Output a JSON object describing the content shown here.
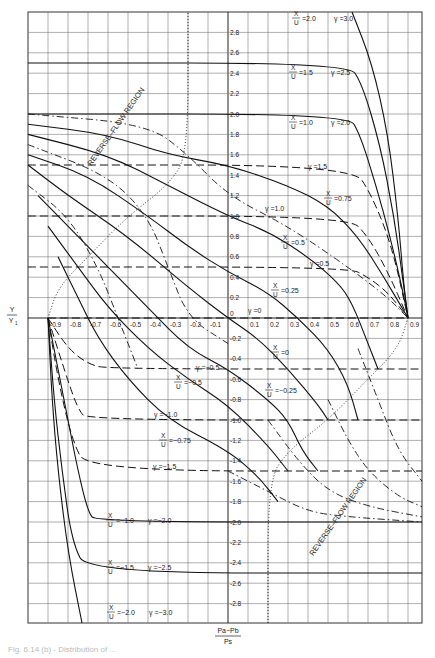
{
  "chart_data": {
    "type": "line",
    "title": "",
    "xlabel": "(Pa - Pb) / Ps",
    "xlabel_parts": {
      "numerator": "Pa−Pb",
      "denominator": "Ps"
    },
    "ylabel": "Y / Y1",
    "ylabel_parts": {
      "numerator": "Y",
      "denominator": "Y1"
    },
    "xlim": [
      -1.0,
      1.0
    ],
    "ylim": [
      -3.0,
      3.0
    ],
    "grid": true,
    "x_ticks": [
      -0.9,
      -0.8,
      -0.7,
      -0.6,
      -0.5,
      -0.4,
      -0.3,
      -0.2,
      -0.1,
      0,
      0.1,
      0.2,
      0.3,
      0.4,
      0.5,
      0.6,
      0.7,
      0.8,
      0.9
    ],
    "x_tick_labels": [
      "-0.9",
      "-0.8",
      "-0.7",
      "-0.6",
      "-0.5",
      "-0.4",
      "-0.3",
      "-0.2",
      "-0.1",
      "0",
      "0.1",
      "0.2",
      "0.3",
      "0.4",
      "0.5",
      "0.6",
      "0.7",
      "0.8",
      "0.9"
    ],
    "y_ticks": [
      2.8,
      2.6,
      2.4,
      2.2,
      2.0,
      1.8,
      1.6,
      1.4,
      1.2,
      1.0,
      0.8,
      0.6,
      0.4,
      0.2,
      -0.2,
      -0.4,
      -0.6,
      -0.8,
      -1.0,
      -1.2,
      -1.4,
      -1.6,
      -1.8,
      -2.0,
      -2.2,
      -2.4,
      -2.6,
      -2.8
    ],
    "y_tick_labels": [
      "2.8",
      "2.6",
      "2.4",
      "2.2",
      "2.0",
      "1.8",
      "1.6",
      "1.4",
      "1.2",
      "1.0",
      "0.8",
      "0.6",
      "0.4",
      "0.2",
      "-0.2",
      "-0.4",
      "-0.6",
      "-0.8",
      "-1.0",
      "-1.2",
      "-1.4",
      "-1.6",
      "-1.8",
      "-2.0",
      "-2.2",
      "-2.4",
      "-2.6",
      "-2.8"
    ],
    "series_solid_x_over_u": [
      {
        "name": "X/U = 2.0",
        "label": "X/U = 2.0  γ = 3.0",
        "points": [
          [
            0.62,
            3.0
          ],
          [
            0.72,
            2.5
          ],
          [
            0.8,
            1.8
          ],
          [
            0.85,
            1.0
          ],
          [
            0.88,
            0.3
          ],
          [
            0.9,
            0.0
          ]
        ]
      },
      {
        "name": "X/U = 1.5",
        "label": "X/U = 1.5  γ = 2.5",
        "points": [
          [
            -1.0,
            2.5
          ],
          [
            0.6,
            2.5
          ],
          [
            0.67,
            2.3
          ],
          [
            0.76,
            1.7
          ],
          [
            0.83,
            1.0
          ],
          [
            0.88,
            0.3
          ],
          [
            0.9,
            0.0
          ]
        ]
      },
      {
        "name": "X/U = 1.0",
        "label": "X/U = 1.0  γ = 2.0",
        "points": [
          [
            -1.0,
            2.0
          ],
          [
            0.6,
            2.0
          ],
          [
            0.66,
            1.8
          ],
          [
            0.74,
            1.3
          ],
          [
            0.81,
            0.8
          ],
          [
            0.87,
            0.3
          ],
          [
            0.9,
            0.0
          ]
        ]
      },
      {
        "name": "X/U = 0.75",
        "label": "X/U = 0.75",
        "points": [
          [
            -1.0,
            1.9
          ],
          [
            -0.6,
            1.8
          ],
          [
            -0.3,
            1.6
          ],
          [
            0.0,
            1.5
          ],
          [
            0.3,
            1.3
          ],
          [
            0.5,
            1.1
          ],
          [
            0.65,
            0.8
          ],
          [
            0.78,
            0.4
          ],
          [
            0.9,
            0.0
          ]
        ]
      },
      {
        "name": "X/U = 0.5",
        "label": "X/U = 0.5",
        "points": [
          [
            -1.0,
            1.8
          ],
          [
            -0.6,
            1.6
          ],
          [
            -0.3,
            1.3
          ],
          [
            0.0,
            1.0
          ],
          [
            0.2,
            0.85
          ],
          [
            0.4,
            0.6
          ],
          [
            0.55,
            0.35
          ],
          [
            0.62,
            0.15
          ],
          [
            0.7,
            -0.25
          ],
          [
            0.75,
            -0.5
          ]
        ]
      },
      {
        "name": "X/U = 0.25",
        "label": "X/U = 0.25",
        "points": [
          [
            -1.0,
            1.6
          ],
          [
            -0.7,
            1.4
          ],
          [
            -0.4,
            1.0
          ],
          [
            -0.2,
            0.7
          ],
          [
            0.0,
            0.45
          ],
          [
            0.2,
            0.25
          ],
          [
            0.35,
            0.0
          ],
          [
            0.5,
            -0.3
          ],
          [
            0.6,
            -0.65
          ],
          [
            0.65,
            -1.0
          ]
        ]
      },
      {
        "name": "X/U = 0",
        "label": "X/U = 0  γ = 0",
        "points": [
          [
            -1.0,
            1.5
          ],
          [
            -0.8,
            1.2
          ],
          [
            -0.5,
            0.8
          ],
          [
            -0.2,
            0.3
          ],
          [
            0.0,
            0.0
          ],
          [
            0.15,
            -0.2
          ],
          [
            0.3,
            -0.5
          ],
          [
            0.45,
            -0.85
          ],
          [
            0.5,
            -1.0
          ]
        ]
      },
      {
        "name": "X/U = -0.25",
        "label": "X/U = -0.25",
        "points": [
          [
            -0.95,
            1.2
          ],
          [
            -0.8,
            0.9
          ],
          [
            -0.6,
            0.5
          ],
          [
            -0.4,
            0.1
          ],
          [
            -0.2,
            -0.3
          ],
          [
            0.0,
            -0.5
          ],
          [
            0.2,
            -0.8
          ],
          [
            0.3,
            -1.0
          ],
          [
            0.37,
            -1.3
          ],
          [
            0.45,
            -1.5
          ]
        ]
      },
      {
        "name": "X/U = -0.5",
        "label": "X/U = -0.5",
        "points": [
          [
            -0.9,
            0.9
          ],
          [
            -0.75,
            0.5
          ],
          [
            -0.6,
            0.1
          ],
          [
            -0.4,
            -0.3
          ],
          [
            -0.2,
            -0.6
          ],
          [
            0.0,
            -0.85
          ],
          [
            0.2,
            -1.25
          ],
          [
            0.3,
            -1.5
          ]
        ]
      },
      {
        "name": "X/U = -0.75",
        "label": "X/U = -0.75",
        "points": [
          [
            -0.85,
            0.6
          ],
          [
            -0.75,
            0.2
          ],
          [
            -0.65,
            -0.2
          ],
          [
            -0.5,
            -0.6
          ],
          [
            -0.3,
            -1.0
          ],
          [
            0.0,
            -1.3
          ],
          [
            0.15,
            -1.55
          ],
          [
            0.25,
            -1.8
          ]
        ]
      },
      {
        "name": "X/U = -1.0",
        "label": "X/U = -1.0  γ = -2.0",
        "points": [
          [
            -0.9,
            0.0
          ],
          [
            -0.85,
            -0.5
          ],
          [
            -0.8,
            -1.0
          ],
          [
            -0.75,
            -1.5
          ],
          [
            -0.7,
            -1.9
          ],
          [
            -0.66,
            -2.0
          ],
          [
            1.0,
            -2.0
          ]
        ]
      },
      {
        "name": "X/U = -1.5",
        "label": "X/U = -1.5  γ = -2.5",
        "points": [
          [
            -0.9,
            0.0
          ],
          [
            -0.87,
            -0.8
          ],
          [
            -0.83,
            -1.5
          ],
          [
            -0.78,
            -2.2
          ],
          [
            -0.7,
            -2.5
          ],
          [
            1.0,
            -2.5
          ]
        ]
      },
      {
        "name": "X/U = -2.0",
        "label": "X/U = -2.0  γ = -3.0",
        "points": [
          [
            -0.9,
            0.0
          ],
          [
            -0.88,
            -0.8
          ],
          [
            -0.85,
            -1.5
          ],
          [
            -0.8,
            -2.3
          ],
          [
            -0.73,
            -3.0
          ]
        ]
      }
    ],
    "series_dashed_gamma": [
      {
        "name": "γ = 1.5",
        "value": 1.5,
        "points": [
          [
            -1.0,
            1.5
          ],
          [
            0.62,
            1.5
          ],
          [
            0.72,
            1.2
          ],
          [
            0.82,
            0.7
          ],
          [
            0.9,
            0.0
          ]
        ]
      },
      {
        "name": "γ = 1.0",
        "value": 1.0,
        "points": [
          [
            -1.0,
            1.0
          ],
          [
            0.6,
            1.0
          ],
          [
            0.7,
            0.8
          ],
          [
            0.8,
            0.45
          ],
          [
            0.9,
            0.0
          ]
        ]
      },
      {
        "name": "γ = 0.5",
        "value": 0.5,
        "points": [
          [
            -1.0,
            0.5
          ],
          [
            0.6,
            0.5
          ],
          [
            0.7,
            0.4
          ],
          [
            0.8,
            0.25
          ],
          [
            0.9,
            0.0
          ]
        ]
      },
      {
        "name": "γ = 0",
        "value": 0,
        "points": [
          [
            -0.9,
            0.0
          ],
          [
            0.9,
            0.0
          ]
        ]
      },
      {
        "name": "γ = -0.5",
        "value": -0.5,
        "points": [
          [
            -0.9,
            0.0
          ],
          [
            -0.8,
            -0.3
          ],
          [
            -0.7,
            -0.45
          ],
          [
            -0.6,
            -0.5
          ],
          [
            1.0,
            -0.5
          ]
        ]
      },
      {
        "name": "γ = -1.0",
        "value": -1.0,
        "points": [
          [
            -0.9,
            0.0
          ],
          [
            -0.82,
            -0.5
          ],
          [
            -0.75,
            -0.9
          ],
          [
            -0.7,
            -1.0
          ],
          [
            1.0,
            -1.0
          ]
        ]
      },
      {
        "name": "γ = -1.5",
        "value": -1.5,
        "points": [
          [
            -0.9,
            0.0
          ],
          [
            -0.85,
            -0.6
          ],
          [
            -0.78,
            -1.2
          ],
          [
            -0.7,
            -1.5
          ],
          [
            1.0,
            -1.5
          ]
        ]
      }
    ],
    "series_dash_dot": [
      {
        "name": "dash-dot upper 1",
        "points": [
          [
            -1.0,
            2.0
          ],
          [
            -0.4,
            1.9
          ],
          [
            -0.2,
            1.6
          ],
          [
            0.0,
            1.2
          ],
          [
            0.3,
            0.9
          ],
          [
            0.6,
            0.5
          ],
          [
            0.8,
            0.2
          ],
          [
            0.9,
            0.0
          ]
        ]
      },
      {
        "name": "dash-dot upper 2",
        "points": [
          [
            -1.0,
            1.7
          ],
          [
            -0.6,
            1.4
          ],
          [
            -0.4,
            1.0
          ],
          [
            -0.3,
            0.5
          ],
          [
            -0.2,
            0.0
          ],
          [
            0.0,
            -0.25
          ]
        ]
      },
      {
        "name": "dash-dot upper 3",
        "points": [
          [
            -1.0,
            1.3
          ],
          [
            -0.8,
            1.0
          ],
          [
            -0.65,
            0.5
          ],
          [
            -0.55,
            0.0
          ],
          [
            -0.45,
            -0.5
          ]
        ]
      },
      {
        "name": "dash-dot lower 1",
        "points": [
          [
            0.0,
            -1.5
          ],
          [
            0.2,
            -1.7
          ],
          [
            0.4,
            -1.9
          ],
          [
            0.6,
            -1.95
          ],
          [
            1.0,
            -2.0
          ]
        ]
      },
      {
        "name": "dash-dot lower 2",
        "points": [
          [
            0.2,
            -1.0
          ],
          [
            0.35,
            -1.4
          ],
          [
            0.5,
            -1.7
          ],
          [
            0.7,
            -1.85
          ],
          [
            1.0,
            -1.95
          ]
        ]
      },
      {
        "name": "dash-dot lower 3",
        "points": [
          [
            0.5,
            -0.8
          ],
          [
            0.6,
            -1.2
          ],
          [
            0.7,
            -1.5
          ],
          [
            0.85,
            -1.75
          ],
          [
            1.0,
            -1.85
          ]
        ]
      },
      {
        "name": "dash-dot lower 4",
        "points": [
          [
            0.65,
            -0.3
          ],
          [
            0.75,
            -0.8
          ],
          [
            0.85,
            -1.3
          ],
          [
            1.0,
            -1.6
          ]
        ]
      }
    ],
    "reverse_flow_boundaries": [
      {
        "name": "upper boundary (dotted)",
        "points": [
          [
            -0.9,
            0.0
          ],
          [
            -0.85,
            0.3
          ],
          [
            -0.7,
            0.6
          ],
          [
            -0.5,
            1.0
          ],
          [
            -0.3,
            1.3
          ],
          [
            -0.2,
            1.6
          ],
          [
            -0.2,
            3.0
          ]
        ]
      },
      {
        "name": "lower boundary (dotted)",
        "points": [
          [
            0.9,
            0.0
          ],
          [
            0.85,
            -0.3
          ],
          [
            0.7,
            -0.6
          ],
          [
            0.5,
            -1.0
          ],
          [
            0.3,
            -1.3
          ],
          [
            0.2,
            -1.6
          ],
          [
            0.2,
            -3.0
          ]
        ]
      }
    ],
    "annotations": [
      {
        "text": "REVERSE–FLOW REGION",
        "x": -0.55,
        "y": 0.9,
        "rotation": -55
      },
      {
        "text": "REVERSE–FLOW REGION",
        "x": 0.55,
        "y": -1.05,
        "rotation": -55
      }
    ],
    "legend": null
  },
  "labels": {
    "y_axis_num": "Y",
    "y_axis_den": "Y",
    "y_axis_den_sub": "1",
    "x_axis_num": "Pa−Pb",
    "x_axis_den": "Ps",
    "reverse_flow_upper": "REVERSE–FLOW REGION",
    "reverse_flow_lower": "REVERSE–FLOW REGION",
    "curve_labels": [
      {
        "xu": "=2.0",
        "g": "γ =3.0"
      },
      {
        "xu": "=1.5",
        "g": "γ =2.5"
      },
      {
        "xu": "=1.0",
        "g": "γ =2.0"
      },
      {
        "xu": "=0.75",
        "g": ""
      },
      {
        "xu": "=0.5",
        "g": ""
      },
      {
        "xu": "=0.25",
        "g": ""
      },
      {
        "xu": "=0",
        "g": ""
      },
      {
        "xu": "=−0.25",
        "g": ""
      },
      {
        "xu": "=−0.5",
        "g": ""
      },
      {
        "xu": "=−0.75",
        "g": ""
      },
      {
        "xu": "=−1.0",
        "g": "γ =−2.0"
      },
      {
        "xu": "=−1.5",
        "g": "γ =−2.5"
      },
      {
        "xu": "=−2.0",
        "g": "γ =−3.0"
      }
    ],
    "gamma_labels": [
      "γ =1.5",
      "γ =1.0",
      "γ =0.5",
      "γ =0",
      "γ =−0.5",
      "γ =−1.0",
      "γ =−1.5"
    ],
    "frac_x": "X",
    "frac_u": "U"
  },
  "caption": "Fig. 6.14 (b) - Distribution of ..."
}
